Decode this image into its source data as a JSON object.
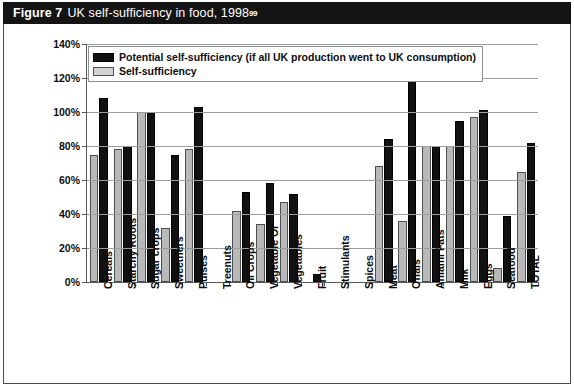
{
  "figure": {
    "number_label": "Figure 7",
    "title": "UK self-sufficiency in food, 1998",
    "footnote_marker": "99"
  },
  "legend": {
    "position": "top-left-inside-plot",
    "entries": [
      {
        "label": "Potential self-sufficiency (if all UK production went to UK consumption)",
        "color": "#111111",
        "key": "potential"
      },
      {
        "label": "Self-sufficiency",
        "color": "#d2d2d2",
        "key": "actual"
      }
    ]
  },
  "chart_data": {
    "type": "bar",
    "title": "UK self-sufficiency in food, 1998",
    "xlabel": "",
    "ylabel": "",
    "ylim": [
      0,
      140
    ],
    "ytick_labels": [
      "0%",
      "20%",
      "40%",
      "60%",
      "80%",
      "100%",
      "120%",
      "140%"
    ],
    "ytick_values": [
      0,
      20,
      40,
      60,
      80,
      100,
      120,
      140
    ],
    "grid": true,
    "legend_position": "upper left",
    "categories": [
      "Cereals",
      "Starchy Roots",
      "Sugar crops",
      "Sweetners",
      "Pulses",
      "Treenuts",
      "Oil Crops",
      "Vegetable Oi",
      "Vegetables",
      "Fruit",
      "Stimulants",
      "Spices",
      "Meat",
      "Offals",
      "Aniaml Fats",
      "Milk",
      "Eggs",
      "Seafood",
      "TOTAL"
    ],
    "series": [
      {
        "name": "Potential self-sufficiency (if all UK production went to UK consumption)",
        "color": "#111111",
        "values": [
          108,
          80,
          100,
          75,
          103,
          0,
          53,
          58,
          52,
          5,
          0,
          0,
          84,
          126,
          80,
          95,
          101,
          39,
          82
        ]
      },
      {
        "name": "Self-sufficiency",
        "color": "#d2d2d2",
        "values": [
          75,
          78,
          100,
          32,
          78,
          0,
          42,
          34,
          47,
          0,
          0,
          0,
          68,
          36,
          80,
          80,
          97,
          8,
          65
        ]
      }
    ]
  }
}
